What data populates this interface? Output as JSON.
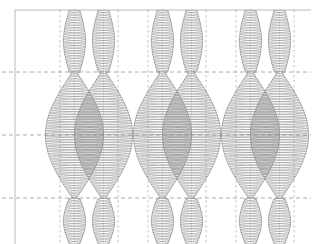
{
  "figure": {
    "title": "",
    "background_color": "#ffffff",
    "width": 320,
    "height": 244
  },
  "style": {
    "axis_color": "#b9b9b9",
    "grid_color": "#9a9a9a",
    "curve_color": "#8d8d8d",
    "envelope_color": "#8d8d8d",
    "vertical_marker_color": "#9a9a9a",
    "axis_width": 1,
    "grid_width": 0.8,
    "curve_width": 0.55,
    "grid_dash": "4 3"
  },
  "chart_data": {
    "type": "line",
    "title": "",
    "xlabel": "",
    "ylabel": "",
    "grid": true,
    "legend": null,
    "axis_frame": {
      "left_spine_x": 15,
      "top_spine_y": 10,
      "right_extent_x": 311,
      "bottom_extent_y": 244
    },
    "xlim": [
      0,
      311
    ],
    "ylim": [
      10,
      244
    ],
    "y_gridlines": [
      10,
      72,
      135,
      198
    ],
    "y_gridline_styles": [
      "solid",
      "dashed",
      "dashed",
      "dashed"
    ],
    "x_envelope_boundaries": [
      60,
      89,
      118,
      148,
      177,
      206,
      236,
      265,
      294
    ],
    "series": [
      {
        "name": "oscillation-column-group-1",
        "center_x": 89,
        "envelope_half_width_max": 29,
        "nodes_y": [
          10,
          72,
          198
        ],
        "antinodes_y": [
          135
        ],
        "oscillations": 46
      },
      {
        "name": "oscillation-column-group-2",
        "center_x": 177,
        "envelope_half_width_max": 29,
        "nodes_y": [
          10,
          72,
          198
        ],
        "antinodes_y": [
          135
        ],
        "oscillations": 46
      },
      {
        "name": "oscillation-column-group-3",
        "center_x": 265,
        "envelope_half_width_max": 29,
        "nodes_y": [
          10,
          72,
          198
        ],
        "antinodes_y": [
          135
        ],
        "oscillations": 46
      }
    ],
    "envelope_profile": {
      "segments": [
        {
          "y_start": 10,
          "y_end": 72,
          "shape": "constant-narrow",
          "half_width_start": 11,
          "half_width_end": 11
        },
        {
          "y_start": 72,
          "y_end": 135,
          "shape": "lens-expand",
          "half_width_start": 2,
          "half_width_end": 29
        },
        {
          "y_start": 135,
          "y_end": 198,
          "shape": "lens-contract",
          "half_width_start": 29,
          "half_width_end": 2
        },
        {
          "y_start": 198,
          "y_end": 244,
          "shape": "constant-narrow",
          "half_width_start": 11,
          "half_width_end": 11
        }
      ]
    }
  }
}
